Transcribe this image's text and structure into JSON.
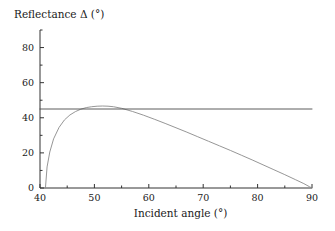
{
  "chart_data": {
    "type": "line",
    "title": "",
    "xlabel": "Incident angle (°)",
    "ylabel": "Reflectance Δ (°)",
    "xlim": [
      40,
      90
    ],
    "ylim": [
      0,
      90
    ],
    "xticks": [
      40,
      50,
      60,
      70,
      80,
      90
    ],
    "xtick_labels": [
      "40",
      "50",
      "60",
      "70",
      "80",
      "90"
    ],
    "xticks_minor": [
      45,
      55,
      65,
      75,
      85
    ],
    "yticks": [
      0,
      20,
      40,
      60,
      80
    ],
    "ytick_labels": [
      "0",
      "20",
      "40",
      "60",
      "80"
    ],
    "yticks_minor": [
      10,
      30,
      50,
      70,
      90
    ],
    "grid": false,
    "legend": false,
    "line_color": "#8a8a8a",
    "axis_color": "#333333",
    "series": [
      {
        "name": "Reflectance phase difference",
        "color": "#8a8a8a",
        "x": [
          41.0,
          41.3,
          41.8,
          42.5,
          43.5,
          44.5,
          45.5,
          46.5,
          47.5,
          48.5,
          49.5,
          50.5,
          51.5,
          52.5,
          53.5,
          55.0,
          57.0,
          59.0,
          61.0,
          63.0,
          65.0,
          67.0,
          69.0,
          71.0,
          73.0,
          75.0,
          77.0,
          79.0,
          81.0,
          83.0,
          85.0,
          87.0,
          88.5,
          89.5,
          90.0
        ],
        "y": [
          0.0,
          12.0,
          20.5,
          28.0,
          34.5,
          38.8,
          41.6,
          43.5,
          44.9,
          45.8,
          46.3,
          46.6,
          46.7,
          46.6,
          46.3,
          45.4,
          43.6,
          41.5,
          39.2,
          36.8,
          34.3,
          31.8,
          29.2,
          26.6,
          24.0,
          21.4,
          18.7,
          16.0,
          13.2,
          10.4,
          7.6,
          4.7,
          2.5,
          0.8,
          0.0
        ]
      },
      {
        "name": "Reference level",
        "color": "#4a4a4a",
        "constant_y": 45,
        "x": [
          40,
          90
        ],
        "y": [
          45,
          45
        ]
      }
    ]
  }
}
